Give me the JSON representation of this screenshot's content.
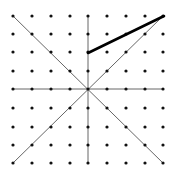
{
  "diagram": {
    "type": "dot-grid-with-lines",
    "grid": {
      "rows": 9,
      "cols": 9,
      "x_positions": [
        13,
        32,
        51,
        70,
        88,
        107,
        126,
        145,
        163
      ],
      "y_positions": [
        16,
        34,
        52,
        71,
        89,
        108,
        127,
        145,
        163
      ],
      "dot_color": "#111111",
      "dot_radius": 1.6
    },
    "thin_lines": [
      {
        "name": "vertical-axis-line",
        "x1": 88,
        "y1": 16,
        "x2": 88,
        "y2": 163
      },
      {
        "name": "horizontal-axis-line",
        "x1": 13,
        "y1": 89,
        "x2": 163,
        "y2": 89
      },
      {
        "name": "diagonal-line-tl-br",
        "x1": 13,
        "y1": 16,
        "x2": 163,
        "y2": 163
      },
      {
        "name": "diagonal-line-bl-tr",
        "x1": 13,
        "y1": 163,
        "x2": 163,
        "y2": 16
      }
    ],
    "thick_lines": [
      {
        "name": "thick-line-segment",
        "x1": 88,
        "y1": 53,
        "x2": 164,
        "y2": 16
      }
    ],
    "thin_color": "#555555",
    "thick_color": "#000000"
  }
}
